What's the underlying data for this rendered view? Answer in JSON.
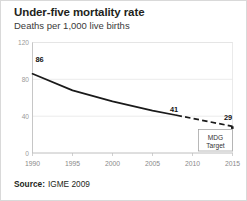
{
  "card": {
    "title": "Under-five mortality rate",
    "subtitle": "Deaths per 1,000 live births",
    "source_label": "Source:",
    "source_value": "IGME 2009"
  },
  "annotation": {
    "line1": "MDG",
    "line2": "Target"
  },
  "chart_data": {
    "type": "line",
    "title": "Under-five mortality rate",
    "subtitle": "Deaths per 1,000 live births",
    "xlabel": "",
    "ylabel": "Deaths per 1,000 live births",
    "xlim": [
      1990,
      2015
    ],
    "ylim": [
      0,
      120
    ],
    "xticks": [
      1990,
      1995,
      2000,
      2005,
      2010,
      2015
    ],
    "xticklabels": [
      "1990",
      "1995",
      "2000",
      "2005",
      "2010",
      "2015"
    ],
    "yticks": [
      0,
      40,
      80,
      120
    ],
    "yticklabels": [
      "0",
      "40",
      "80",
      "120"
    ],
    "grid": true,
    "legend": false,
    "series": [
      {
        "name": "Observed under-five mortality rate",
        "style": "solid",
        "x": [
          1990,
          1995,
          2000,
          2005,
          2008
        ],
        "values": [
          86,
          68,
          56,
          46,
          41
        ]
      },
      {
        "name": "Projection to MDG target",
        "style": "dashed",
        "x": [
          2008,
          2015
        ],
        "values": [
          41,
          29
        ]
      }
    ],
    "point_labels": [
      {
        "x": 1990,
        "value": 86,
        "text": "86"
      },
      {
        "x": 2008,
        "value": 41,
        "text": "41"
      },
      {
        "x": 2015,
        "value": 29,
        "text": "29"
      }
    ],
    "annotations": [
      {
        "text": "MDG Target",
        "x": 2012,
        "y": 12
      }
    ]
  }
}
